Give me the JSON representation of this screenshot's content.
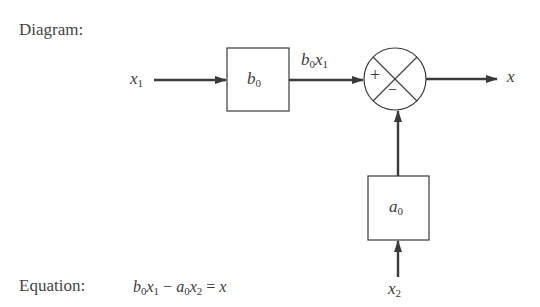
{
  "heading": "Diagram:",
  "blocks": {
    "b0": {
      "var": "b",
      "sub": "0"
    },
    "a0": {
      "var": "a",
      "sub": "0"
    }
  },
  "signals": {
    "x1": {
      "var": "x",
      "sub": "1"
    },
    "b0x1": {
      "v1": "b",
      "s1": "0",
      "v2": "x",
      "s2": "1"
    },
    "x": {
      "var": "x"
    },
    "x2": {
      "var": "x",
      "sub": "2"
    }
  },
  "summer": {
    "plus": "+",
    "minus": "−"
  },
  "equation": {
    "label": "Equation:",
    "parts": {
      "b": "b",
      "b_sub": "0",
      "x1": "x",
      "x1_sub": "1",
      "op": " − ",
      "a": "a",
      "a_sub": "0",
      "x2": "x",
      "x2_sub": "2",
      "eq": " = ",
      "x": "x"
    }
  },
  "colors": {
    "line": "#3a3a3a",
    "text": "#444444"
  }
}
